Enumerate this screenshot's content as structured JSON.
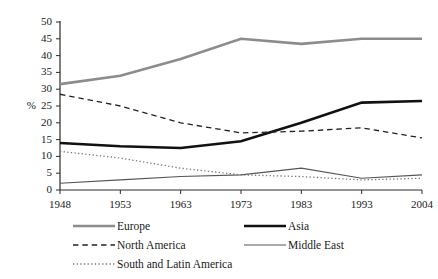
{
  "chart_data": {
    "type": "line",
    "title": "",
    "subtitle": "",
    "xlabel": "",
    "ylabel": "%",
    "categories": [
      "1948",
      "1953",
      "1963",
      "1973",
      "1983",
      "1993",
      "2004"
    ],
    "ylim": [
      0,
      50
    ],
    "y_ticks": [
      0,
      5,
      10,
      15,
      20,
      25,
      30,
      35,
      40,
      45,
      50
    ],
    "grid": false,
    "legend_position": "bottom",
    "series": [
      {
        "name": "Europe",
        "values": [
          31.5,
          34,
          39,
          45,
          43.5,
          45,
          45
        ],
        "color": "#8c8c8c",
        "style": "solid",
        "width": 2.6
      },
      {
        "name": "Asia",
        "values": [
          14,
          13,
          12.5,
          14.5,
          20,
          26,
          26.5
        ],
        "color": "#111111",
        "style": "solid",
        "width": 2.6
      },
      {
        "name": "North America",
        "values": [
          28.5,
          25,
          20,
          17,
          17.5,
          18.5,
          15.5
        ],
        "color": "#222222",
        "style": "dashed",
        "width": 1.3
      },
      {
        "name": "Middle East",
        "values": [
          2,
          3,
          4,
          4.5,
          6.5,
          3.5,
          4.5
        ],
        "color": "#555555",
        "style": "solid",
        "width": 1.1
      },
      {
        "name": "South and Latin America",
        "values": [
          11.5,
          9.5,
          6.5,
          4.5,
          4,
          3,
          3.5
        ],
        "color": "#777777",
        "style": "dotted",
        "width": 1.3
      }
    ]
  },
  "legend": {
    "entries": [
      {
        "label": "Europe"
      },
      {
        "label": "Asia"
      },
      {
        "label": "North America"
      },
      {
        "label": "Middle East"
      },
      {
        "label": "South and Latin America"
      }
    ]
  },
  "axes": {
    "y_title": "%",
    "y_tick_labels": [
      "50",
      "45",
      "40",
      "35",
      "30",
      "25",
      "20",
      "15",
      "10",
      "5",
      "0"
    ],
    "x_tick_labels": [
      "1948",
      "1953",
      "1963",
      "1973",
      "1983",
      "1993",
      "2004"
    ]
  }
}
